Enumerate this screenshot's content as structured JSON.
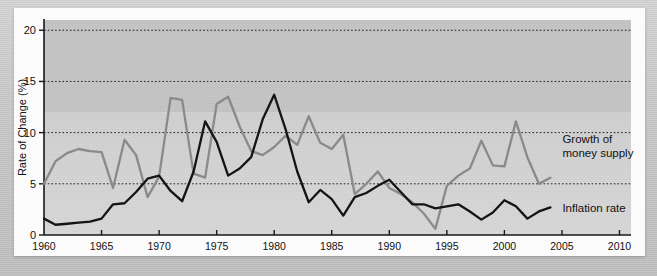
{
  "chart_data": {
    "type": "line",
    "title": "",
    "xlabel": "Year",
    "ylabel": "Rate of Change (%)",
    "xlim": [
      1960,
      2011
    ],
    "ylim": [
      0,
      21
    ],
    "xticks": [
      1960,
      1965,
      1970,
      1975,
      1980,
      1985,
      1990,
      1995,
      2000,
      2005,
      2010
    ],
    "yticks": [
      0,
      5,
      10,
      15,
      20
    ],
    "grid": "horizontal dotted at 5, 10, 15, 20",
    "legend_position": "inline right, next to each line",
    "x": [
      1960,
      1961,
      1962,
      1963,
      1964,
      1965,
      1966,
      1967,
      1968,
      1969,
      1970,
      1971,
      1972,
      1973,
      1974,
      1975,
      1976,
      1977,
      1978,
      1979,
      1980,
      1981,
      1982,
      1983,
      1984,
      1985,
      1986,
      1987,
      1988,
      1989,
      1990,
      1991,
      1992,
      1993,
      1994,
      1995,
      1996,
      1997,
      1998,
      1999,
      2000,
      2001,
      2002,
      2003,
      2004
    ],
    "series": [
      {
        "name": "Growth of money supply",
        "color": "#8a8a8a",
        "label_lines": [
          "Growth of",
          "money supply"
        ],
        "values": [
          5.0,
          7.2,
          8.0,
          8.4,
          8.2,
          8.1,
          4.6,
          9.3,
          7.8,
          3.7,
          5.7,
          13.4,
          13.2,
          6.0,
          5.6,
          12.8,
          13.5,
          10.6,
          8.2,
          7.8,
          8.6,
          9.7,
          8.8,
          11.6,
          9.0,
          8.4,
          9.8,
          4.0,
          5.0,
          6.2,
          4.6,
          4.0,
          3.2,
          2.1,
          0.6,
          4.8,
          5.8,
          6.5,
          9.2,
          6.8,
          6.7,
          11.1,
          7.6,
          5.0,
          5.6
        ]
      },
      {
        "name": "Inflation rate",
        "color": "#141414",
        "label_lines": [
          "Inflation rate"
        ],
        "values": [
          1.6,
          1.0,
          1.1,
          1.2,
          1.3,
          1.6,
          3.0,
          3.1,
          4.2,
          5.5,
          5.8,
          4.3,
          3.3,
          6.2,
          11.1,
          9.1,
          5.8,
          6.5,
          7.6,
          11.3,
          13.7,
          10.3,
          6.2,
          3.2,
          4.4,
          3.5,
          1.9,
          3.7,
          4.1,
          4.8,
          5.4,
          4.2,
          3.0,
          3.0,
          2.6,
          2.8,
          3.0,
          2.3,
          1.5,
          2.2,
          3.4,
          2.8,
          1.6,
          2.3,
          2.7
        ]
      }
    ],
    "annotations": [
      {
        "text": "Growth of money supply",
        "series": "Growth of money supply",
        "near_year": 2004
      },
      {
        "text": "Inflation rate",
        "series": "Inflation rate",
        "near_year": 2004
      }
    ]
  },
  "axis": {
    "y_title": "Rate of Change (%)",
    "x_title": "Year",
    "y_tick_labels": [
      "0",
      "5",
      "10",
      "15",
      "20"
    ],
    "x_tick_labels": [
      "1960",
      "1965",
      "1970",
      "1975",
      "1980",
      "1985",
      "1990",
      "1995",
      "2000",
      "2005",
      "2010"
    ]
  },
  "labels": {
    "money_line1": "Growth of",
    "money_line2": "money supply",
    "inflation": "Inflation rate"
  },
  "colors": {
    "money_supply": "#8a8a8a",
    "inflation": "#141414",
    "panel": "#c7c7c7",
    "card": "#fbfbfb",
    "mat": "#c9c9c9"
  }
}
